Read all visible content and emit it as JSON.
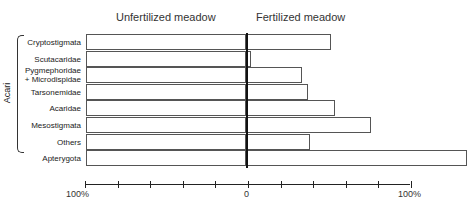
{
  "chart_data": {
    "type": "bar",
    "orientation": "horizontal",
    "title": "",
    "panels": [
      "Unfertilized meadow",
      "Fertilized meadow"
    ],
    "categories": [
      "Cryptostigmata",
      "Scutacaridae",
      "Pygmephoridae + Microdispidae",
      "Tarsonemidae",
      "Acaridae",
      "Mesostigmata",
      "Others",
      "Apterygota"
    ],
    "group_label": "Acari",
    "group_members": [
      "Cryptostigmata",
      "Scutacaridae",
      "Pygmephoridae + Microdispidae",
      "Tarsonemidae",
      "Acaridae",
      "Mesostigmata",
      "Others"
    ],
    "series": [
      {
        "name": "Unfertilized meadow",
        "values": [
          100,
          100,
          100,
          100,
          100,
          100,
          100,
          100
        ]
      },
      {
        "name": "Fertilized meadow",
        "values": [
          52,
          3,
          34,
          38,
          54,
          76,
          39,
          135
        ]
      }
    ],
    "xlabel": "",
    "ylabel": "",
    "x_tick_labels_left": [
      "100%",
      "0"
    ],
    "x_tick_labels_right": [
      "0",
      "100%"
    ],
    "xlim": [
      0,
      100
    ],
    "grid": false,
    "legend": "none"
  },
  "panels": {
    "left_title": "Unfertilized meadow",
    "right_title": "Fertilized meadow"
  },
  "group_label": "Acari",
  "rows": [
    {
      "label": "Cryptostigmata",
      "l1": "Cryptostigmata",
      "l2": "",
      "right": 52
    },
    {
      "label": "Scutacaridae",
      "l1": "Scutacaridae",
      "l2": "",
      "right": 3
    },
    {
      "label": "Pygmephoridae + Microdispidae",
      "l1": "Pygmephoridae",
      "l2": "+ Microdispidae",
      "right": 34
    },
    {
      "label": "Tarsonemidae",
      "l1": "Tarsonemidae",
      "l2": "",
      "right": 38
    },
    {
      "label": "Acaridae",
      "l1": "Acaridae",
      "l2": "",
      "right": 54
    },
    {
      "label": "Mesostigmata",
      "l1": "Mesostigmata",
      "l2": "",
      "right": 76
    },
    {
      "label": "Others",
      "l1": "Others",
      "l2": "",
      "right": 39
    },
    {
      "label": "Apterygota",
      "l1": "Apterygota",
      "l2": "",
      "right": 135
    }
  ],
  "axis": {
    "left_end": "100%",
    "zero": "0",
    "right_end": "100%"
  }
}
